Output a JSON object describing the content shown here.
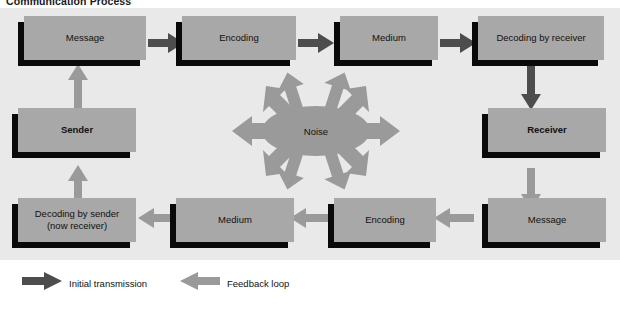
{
  "title": "Communication Process",
  "colors": {
    "panel_bg": "#e9e9e9",
    "box_fill": "#a8a8a8",
    "noise_fill": "#9a9a9a",
    "shadow": "#0a0a0a",
    "arrow_dark": "#4d4d4d",
    "arrow_light": "#9a9a9a",
    "text": "#111111",
    "page_bg": "#ffffff"
  },
  "diagram": {
    "top_row": [
      {
        "id": "message-top",
        "label": "Message"
      },
      {
        "id": "encoding-top",
        "label": "Encoding"
      },
      {
        "id": "medium-top",
        "label": "Medium"
      },
      {
        "id": "decoding-by-receiver",
        "label": "Decoding by receiver"
      }
    ],
    "bottom_row": [
      {
        "id": "decoding-by-sender",
        "label": "Decoding by sender\n(now receiver)",
        "line1": "Decoding by sender",
        "line2": "(now receiver)"
      },
      {
        "id": "medium-bottom",
        "label": "Medium"
      },
      {
        "id": "encoding-bottom",
        "label": "Encoding"
      },
      {
        "id": "message-bottom",
        "label": "Message"
      }
    ],
    "actors": [
      {
        "id": "sender",
        "label": "Sender"
      },
      {
        "id": "receiver",
        "label": "Receiver"
      }
    ],
    "noise": {
      "id": "noise",
      "label": "Noise"
    }
  },
  "legend": {
    "items": [
      {
        "id": "initial-transmission",
        "label": "Initial transmission",
        "style": "dark"
      },
      {
        "id": "feedback-loop",
        "label": "Feedback loop",
        "style": "light"
      }
    ]
  }
}
